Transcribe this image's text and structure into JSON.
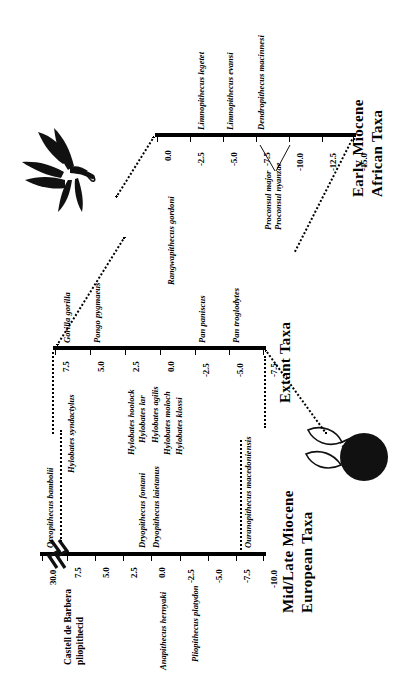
{
  "figure": {
    "type": "phylogenetic-timeline",
    "orientation": "rotated-90-ccw",
    "background": "#ffffff",
    "ink": "#000000"
  },
  "panels": [
    {
      "id": "early-miocene",
      "heading_line1": "Early Miocene",
      "heading_line2": "African Taxa",
      "axis_label": "Early Miocene African Taxa",
      "ticks": [
        "0.0",
        "-2.5",
        "-5.0",
        "-7.5",
        "-10.0",
        "-12.5",
        "-15.0"
      ],
      "tick_values": [
        0.0,
        -2.5,
        -5.0,
        -7.5,
        -10.0,
        -12.5,
        -15.0
      ],
      "taxa": [
        {
          "name": "Rangwapithecus gordoni",
          "at": 0.0
        },
        {
          "name": "Limnopithecus legetet",
          "at": -2.0
        },
        {
          "name": "Limnopithecus evansi",
          "at": -4.0
        },
        {
          "name": "Dendropithecus macinnesi",
          "at": -6.5
        },
        {
          "name": "Proconsul major",
          "at": -9.0
        },
        {
          "name": "Proconsul nyanzae",
          "at": -9.0
        }
      ]
    },
    {
      "id": "extant",
      "heading_line1": "Extant Taxa",
      "heading_line2": "",
      "axis_label": "Extant Taxa",
      "ticks": [
        "7.5",
        "5.0",
        "2.5",
        "0.0",
        "-2.5",
        "-5.0",
        "-7.5"
      ],
      "tick_values": [
        7.5,
        5.0,
        2.5,
        0.0,
        -2.5,
        -5.0,
        -7.5
      ],
      "taxa": [
        {
          "name": "Hylobates syndactylus",
          "at": 7.0
        },
        {
          "name": "Gorilla gorilla",
          "at": 7.2
        },
        {
          "name": "Pongo pygmaeus",
          "at": 5.0
        },
        {
          "name": "Hylobates hoolock",
          "at": 2.5
        },
        {
          "name": "Hylobates lar",
          "at": 1.6
        },
        {
          "name": "Hylobates agilis",
          "at": 0.6
        },
        {
          "name": "Hylobates moloch",
          "at": -0.4
        },
        {
          "name": "Hylobates klossi",
          "at": -1.5
        },
        {
          "name": "Pan paniscus",
          "at": -2.5
        },
        {
          "name": "Pan troglodytes",
          "at": -5.0
        }
      ]
    },
    {
      "id": "mid-late-miocene",
      "heading_line1": "Mid/Late Miocene",
      "heading_line2": "European Taxa",
      "axis_label": "Mid/Late Miocene European Taxa",
      "ticks": [
        "30.0",
        "7.5",
        "5.0",
        "2.5",
        "0.0",
        "-2.5",
        "-5.0",
        "-7.5",
        "-10.0"
      ],
      "tick_values": [
        30.0,
        7.5,
        5.0,
        2.5,
        0.0,
        -2.5,
        -5.0,
        -7.5,
        -10.0
      ],
      "axis_break": true,
      "taxa": [
        {
          "name": "Oreopithecus bambolii",
          "at": 30.0,
          "italic": true
        },
        {
          "name": "Castell de Barbera pliopithecid",
          "at": 7.2,
          "italic": false
        },
        {
          "name": "Dryopithecus fontani",
          "at": 1.6,
          "italic": true
        },
        {
          "name": "Dryopithecus laietanus",
          "at": 0.4,
          "italic": true
        },
        {
          "name": "Anapithecus hernyaki",
          "at": 0.0,
          "italic": true
        },
        {
          "name": "Pliopithecus platydon",
          "at": -2.5,
          "italic": true
        },
        {
          "name": "Ouranopithecus macedoniensis",
          "at": -8.2,
          "italic": true
        }
      ]
    }
  ],
  "decorations": [
    {
      "name": "leaf-sprig-illustration",
      "position": "upper-left"
    },
    {
      "name": "berry-fruit-illustration",
      "position": "lower-right"
    }
  ]
}
